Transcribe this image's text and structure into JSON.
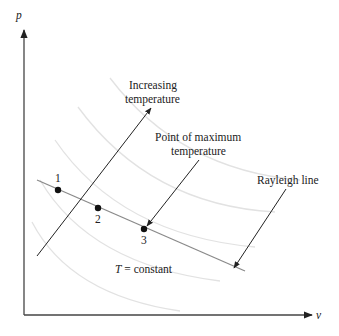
{
  "diagram": {
    "axes": {
      "y_label": "p",
      "x_label": "v"
    },
    "labels": {
      "increasing_temp_line1": "Increasing",
      "increasing_temp_line2": "temperature",
      "max_temp_line1": "Point of maximum",
      "max_temp_line2": "temperature",
      "rayleigh": "Rayleigh line",
      "t_constant_T": "T",
      "t_constant_rest": " = constant"
    },
    "points": [
      {
        "label": "1",
        "x": 58,
        "y": 190
      },
      {
        "label": "2",
        "x": 98,
        "y": 208
      },
      {
        "label": "3",
        "x": 144,
        "y": 229
      }
    ],
    "colors": {
      "ink": "#222222",
      "isotherm": "#e3e3e3",
      "rayleigh": "#8a8a8a",
      "axis": "#555555"
    }
  }
}
